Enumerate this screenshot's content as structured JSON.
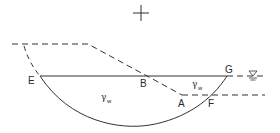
{
  "diagram": {
    "type": "slope-stability-circular-failure-surface",
    "points": {
      "E": "E",
      "B": "B",
      "G": "G",
      "A": "A",
      "F": "F"
    },
    "regions": {
      "main_region_label": "γ",
      "main_region_sub": "w",
      "right_region_label": "γ",
      "right_region_sub": "w"
    },
    "symbols": {
      "center_of_rotation": "cross",
      "water_table": "water-level-symbol"
    },
    "colors": {
      "line": "#333333",
      "background": "#ffffff"
    }
  }
}
